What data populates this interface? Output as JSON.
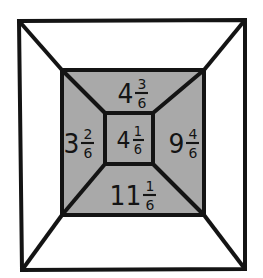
{
  "figure": {
    "colors": {
      "background": "#ffffff",
      "ink": "#141414",
      "gray_fill": "#a9a9a9",
      "inner_fill": "#a9a9a9"
    },
    "geometry": {
      "outer_frame": {
        "x1": 19,
        "y1": 21,
        "x2": 245,
        "y2": 269
      },
      "gray_rect": {
        "x1": 62,
        "y1": 70,
        "x2": 204,
        "y2": 215
      },
      "inner_square": {
        "x1": 105,
        "y1": 113,
        "x2": 153,
        "y2": 164
      },
      "diagonals": "four corner-to-corner lines from outer frame corners to gray rect corners, continuing to inner square corners",
      "stroke_width": 4
    }
  },
  "labels": {
    "top": {
      "region": "top-trapezoid",
      "whole": "4",
      "numerator": "3",
      "denominator": "6",
      "value": "4 3/6"
    },
    "left": {
      "region": "left-trapezoid",
      "whole": "3",
      "numerator": "2",
      "denominator": "6",
      "value": "3 2/6"
    },
    "center": {
      "region": "inner-square",
      "whole": "4",
      "numerator": "1",
      "denominator": "6",
      "value": "4 1/6"
    },
    "right": {
      "region": "right-trapezoid",
      "whole": "9",
      "numerator": "4",
      "denominator": "6",
      "value": "9 4/6"
    },
    "bottom": {
      "region": "bottom-trapezoid",
      "whole": "11",
      "numerator": "1",
      "denominator": "6",
      "value": "11 1/6"
    }
  }
}
